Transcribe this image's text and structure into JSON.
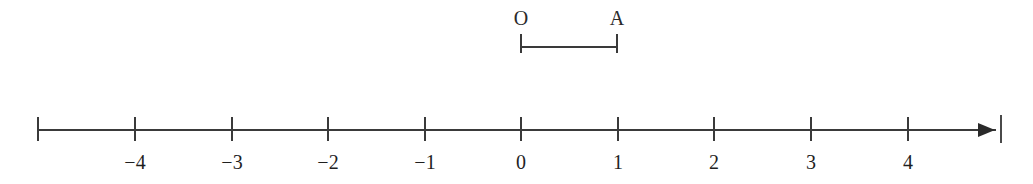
{
  "figure": {
    "background_color": "#ffffff",
    "stroke_color": "#3a3a3a",
    "text_color": "#1f1f1f",
    "width": 1033,
    "height": 184
  },
  "segment": {
    "name": "segment-OA",
    "start_label": "O",
    "end_label": "A",
    "start_value": 0,
    "end_value": 1,
    "length_units": 1,
    "start_x": 521,
    "end_x": 617,
    "bar_y": 46,
    "label_y": 8,
    "cap_top": 34,
    "cap_bottom": 53
  },
  "number_line": {
    "name": "number-line",
    "axis_y": 129,
    "line_start_x": 38,
    "line_end_x": 996,
    "tick_top": 117,
    "tick_bottom": 141,
    "label_y": 152,
    "unit_spacing_px": 97,
    "origin_x": 521,
    "has_arrow_right": true,
    "arrow_x": 978,
    "edge_rule_x": 1000,
    "ticks": [
      {
        "value": -5,
        "x": 38,
        "label": ""
      },
      {
        "value": -4,
        "x": 135,
        "label": "−4"
      },
      {
        "value": -3,
        "x": 232,
        "label": "−3"
      },
      {
        "value": -2,
        "x": 328,
        "label": "−2"
      },
      {
        "value": -1,
        "x": 425,
        "label": "−1"
      },
      {
        "value": 0,
        "x": 521,
        "label": "0"
      },
      {
        "value": 1,
        "x": 618,
        "label": "1"
      },
      {
        "value": 2,
        "x": 714,
        "label": "2"
      },
      {
        "value": 3,
        "x": 811,
        "label": "3"
      },
      {
        "value": 4,
        "x": 908,
        "label": "4"
      }
    ]
  }
}
